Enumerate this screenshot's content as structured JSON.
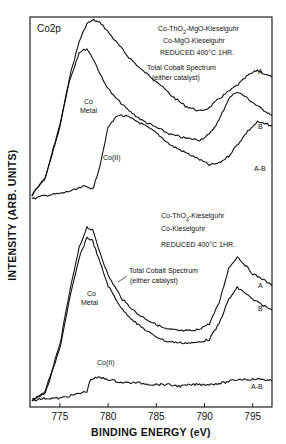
{
  "chart_data": {
    "type": "line",
    "title": "Co2p",
    "xlabel": "BINDING ENERGY (eV)",
    "ylabel": "INTENSITY (ARB. UNITS)",
    "xlim": [
      771.9,
      797.0
    ],
    "x_ticks": [
      775,
      780,
      785,
      790,
      795
    ],
    "grid": false,
    "panels": [
      {
        "name": "top",
        "catalysts": [
          "Co-ThO2-MgO-Kieselguhr",
          "Co-MgO-Kieselguhr"
        ],
        "condition": "REDUCED 400°C 1HR.",
        "series": [
          {
            "name": "A",
            "description": "Total Cobalt Spectrum (either catalyst)",
            "x": [
              772.1,
              773.5,
              775.0,
              776.0,
              777.0,
              777.8,
              778.5,
              779.3,
              780.5,
              782.0,
              783.5,
              785.0,
              786.5,
              788.0,
              789.5,
              790.5,
              791.5,
              792.5,
              793.5,
              794.5,
              795.5,
              796.2,
              797.0
            ],
            "y": [
              0.02,
              0.12,
              0.4,
              0.68,
              0.88,
              0.98,
              1.0,
              0.98,
              0.9,
              0.8,
              0.72,
              0.66,
              0.58,
              0.52,
              0.49,
              0.51,
              0.56,
              0.6,
              0.64,
              0.69,
              0.72,
              0.7,
              0.68
            ]
          },
          {
            "name": "B",
            "x": [
              772.1,
              773.5,
              775.0,
              776.0,
              777.0,
              777.8,
              778.5,
              779.5,
              780.5,
              782.0,
              783.5,
              785.0,
              786.5,
              788.0,
              789.5,
              790.5,
              791.5,
              792.5,
              793.3,
              794.0,
              795.0,
              796.0,
              797.0
            ],
            "y": [
              0.02,
              0.12,
              0.42,
              0.66,
              0.82,
              0.84,
              0.78,
              0.66,
              0.58,
              0.5,
              0.44,
              0.4,
              0.36,
              0.34,
              0.33,
              0.36,
              0.44,
              0.56,
              0.6,
              0.58,
              0.54,
              0.5,
              0.47
            ]
          },
          {
            "name": "A-B",
            "annotation": "Co(II)",
            "x": [
              772.1,
              773.5,
              775.0,
              776.5,
              777.5,
              778.5,
              779.2,
              780.0,
              781.0,
              782.0,
              783.5,
              785.0,
              786.5,
              788.0,
              789.5,
              790.5,
              791.5,
              792.5,
              793.5,
              794.5,
              795.5,
              796.2,
              797.0
            ],
            "y": [
              0.0,
              0.02,
              0.03,
              0.05,
              0.07,
              0.06,
              0.2,
              0.4,
              0.47,
              0.46,
              0.42,
              0.37,
              0.3,
              0.26,
              0.22,
              0.19,
              0.2,
              0.24,
              0.31,
              0.38,
              0.43,
              0.42,
              0.41
            ]
          }
        ],
        "annotations": [
          "Co Metal",
          "Co(II)",
          "Total Cobalt Spectrum (either catalyst)"
        ]
      },
      {
        "name": "bottom",
        "catalysts": [
          "Co-ThO2-Kieselguhr",
          "Co-Kieselguhr"
        ],
        "condition": "REDUCED 400°C 1HR.",
        "series": [
          {
            "name": "A",
            "description": "Total Cobalt Spectrum (either catalyst)",
            "x": [
              772.1,
              773.5,
              775.0,
              776.0,
              777.0,
              777.8,
              778.4,
              779.0,
              780.0,
              781.5,
              783.0,
              784.5,
              786.0,
              787.5,
              789.0,
              790.5,
              791.5,
              792.5,
              793.4,
              794.2,
              795.0,
              796.0,
              797.0
            ],
            "y": [
              0.0,
              0.05,
              0.32,
              0.62,
              0.88,
              1.0,
              0.98,
              0.88,
              0.72,
              0.58,
              0.5,
              0.45,
              0.41,
              0.4,
              0.4,
              0.44,
              0.56,
              0.76,
              0.83,
              0.78,
              0.73,
              0.7,
              0.66
            ]
          },
          {
            "name": "B",
            "x": [
              772.1,
              773.5,
              775.0,
              776.0,
              777.0,
              777.8,
              778.4,
              779.0,
              780.0,
              781.5,
              783.0,
              784.5,
              786.0,
              787.5,
              789.0,
              790.5,
              791.5,
              792.5,
              793.4,
              794.2,
              795.0,
              796.0,
              797.0
            ],
            "y": [
              0.0,
              0.04,
              0.3,
              0.58,
              0.82,
              0.94,
              0.92,
              0.82,
              0.66,
              0.52,
              0.44,
              0.38,
              0.34,
              0.33,
              0.33,
              0.35,
              0.44,
              0.58,
              0.65,
              0.62,
              0.58,
              0.55,
              0.52
            ]
          },
          {
            "name": "A-B",
            "annotation": "Co(II)",
            "x": [
              772.1,
              773.5,
              775.0,
              776.5,
              777.8,
              778.2,
              779.0,
              780.0,
              781.5,
              783.0,
              784.5,
              786.0,
              787.5,
              789.0,
              790.5,
              792.0,
              793.5,
              795.0,
              796.0,
              797.0
            ],
            "y": [
              0.0,
              0.01,
              0.01,
              0.03,
              0.05,
              0.12,
              0.13,
              0.12,
              0.1,
              0.1,
              0.09,
              0.09,
              0.08,
              0.09,
              0.09,
              0.1,
              0.12,
              0.12,
              0.12,
              0.11
            ]
          }
        ],
        "annotations": [
          "Co Metal",
          "Co(II)",
          "Total Cobalt Spectrum (either catalyst)"
        ]
      }
    ]
  },
  "labels": {
    "title": "Co2p",
    "top_cat1_a": "Co-ThO",
    "top_cat1_sub": "2",
    "top_cat1_b": "-MgO-Kieselguhr",
    "top_cat2": "Co-MgO-Kieselguhr",
    "top_cond": "REDUCED 400°C 1HR.",
    "top_total1": "Total Cobalt Spectrum",
    "top_total2": "(either catalyst)",
    "top_co_metal1": "Co",
    "top_co_metal2": "Metal",
    "top_co2": "Co(II)",
    "top_A": "A",
    "top_B": "B",
    "top_AB": "A-B",
    "bot_cat1_a": "Co-ThO",
    "bot_cat1_sub": "2",
    "bot_cat1_b": "-Kieselguhr",
    "bot_cat2": "Co-Kieselguhr",
    "bot_cond": "REDUCED 400°C 1HR.",
    "bot_total1": "Total Cobalt Spectrum",
    "bot_total2": "(either catalyst)",
    "bot_co_metal1": "Co",
    "bot_co_metal2": "Metal",
    "bot_co2": "Co(II)",
    "bot_A": "A",
    "bot_B": "B",
    "bot_AB": "A-B",
    "ylabel": "INTENSITY (ARB. UNITS)",
    "xlabel": "BINDING ENERGY (eV)",
    "ticks": [
      "775",
      "780",
      "785",
      "790",
      "795"
    ]
  }
}
